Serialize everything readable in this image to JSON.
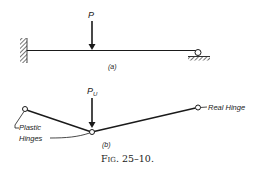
{
  "figure": {
    "caption": "Fig. 25–10.",
    "caption_fig": "Fig.",
    "caption_num": "25–10.",
    "colors": {
      "ink": "#1a1a1a",
      "background": "#ffffff"
    }
  },
  "part_a": {
    "label": "(a)",
    "load_label": "P",
    "supports": {
      "left": "fixed-wall",
      "right": "roller"
    }
  },
  "part_b": {
    "label": "(b)",
    "load_label": "P",
    "load_subscript": "U",
    "annotations": {
      "real_hinge": "Real Hinge",
      "plastic_line1": "Plastic",
      "plastic_line2": "Hinges"
    }
  }
}
